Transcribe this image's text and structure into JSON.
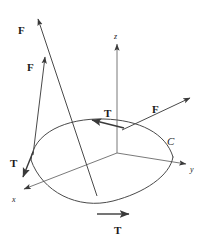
{
  "figure": {
    "kind": "vector-field-line-integral-diagram",
    "background_color": "#ffffff",
    "stroke_color": "#3a3a3a",
    "text_color": "#1a1a1a",
    "width": 205,
    "height": 241
  },
  "axes": {
    "origin": {
      "x": 117,
      "y": 153
    },
    "items": [
      {
        "name": "z-axis",
        "label": "z",
        "label_x": 114,
        "label_y": 33,
        "tip_x": 117,
        "tip_y": 43,
        "style": "italic"
      },
      {
        "name": "y-axis",
        "label": "y",
        "label_x": 190,
        "label_y": 166,
        "tip_x": 186,
        "tip_y": 166,
        "style": "italic"
      },
      {
        "name": "x-axis",
        "label": "x",
        "label_x": 12,
        "label_y": 196,
        "tip_x": 22,
        "tip_y": 190,
        "style": "italic"
      }
    ]
  },
  "curve": {
    "name": "oriented-curve-C",
    "label": "C",
    "label_x": 167,
    "label_y": 136
  },
  "vectors": [
    {
      "name": "force-vector-upper-left-long",
      "label": "F",
      "label_x": 18,
      "label_y": 25,
      "tail_x": 97,
      "tail_y": 196,
      "tip_x": 37,
      "tip_y": 17
    },
    {
      "name": "force-vector-upper-left-short",
      "label": "F",
      "label_x": 27,
      "label_y": 62,
      "tail_x": 33,
      "tail_y": 155,
      "tip_x": 45,
      "tip_y": 55
    },
    {
      "name": "force-vector-right",
      "label": "F",
      "label_x": 152,
      "label_y": 104,
      "tail_x": 122,
      "tail_y": 130,
      "tip_x": 192,
      "tip_y": 97
    },
    {
      "name": "tangent-vector-top",
      "label": "T",
      "label_x": 104,
      "label_y": 108,
      "tail_x": 124,
      "tail_y": 128,
      "tip_x": 91,
      "tip_y": 121
    },
    {
      "name": "tangent-vector-left",
      "label": "T",
      "label_x": 10,
      "label_y": 158,
      "tail_x": 33,
      "tail_y": 152,
      "tip_x": 22,
      "tip_y": 179
    },
    {
      "name": "tangent-vector-bottom",
      "label": "T",
      "label_x": 114,
      "label_y": 225,
      "tail_x": 97,
      "tail_y": 214,
      "tip_x": 131,
      "tip_y": 214
    }
  ]
}
